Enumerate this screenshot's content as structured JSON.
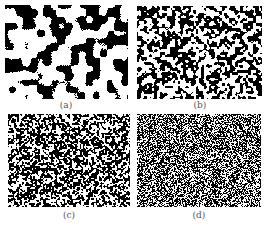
{
  "figure": {
    "panels": [
      {
        "id": "a",
        "label": "(a)",
        "texture": "coarse",
        "x": 5,
        "y": 5,
        "w": 123,
        "h": 94,
        "grain": 7,
        "black_fraction": 0.42,
        "seed": 11
      },
      {
        "id": "b",
        "label": "(b)",
        "texture": "medium",
        "x": 137,
        "y": 6,
        "w": 125,
        "h": 93,
        "grain": 2.6,
        "black_fraction": 0.5,
        "seed": 23
      },
      {
        "id": "c",
        "label": "(c)",
        "texture": "fine",
        "x": 8,
        "y": 114,
        "w": 122,
        "h": 93,
        "grain": 1.6,
        "black_fraction": 0.55,
        "seed": 37
      },
      {
        "id": "d",
        "label": "(d)",
        "texture": "finest",
        "x": 137,
        "y": 114,
        "w": 124,
        "h": 93,
        "grain": 1.0,
        "black_fraction": 0.55,
        "seed": 53
      }
    ],
    "labels": {
      "a": "(a)",
      "b": "(b)",
      "c": "(c)",
      "d": "(d)"
    }
  },
  "colors": {
    "ink": "#000000",
    "paper": "#ffffff",
    "label": "#555555"
  }
}
